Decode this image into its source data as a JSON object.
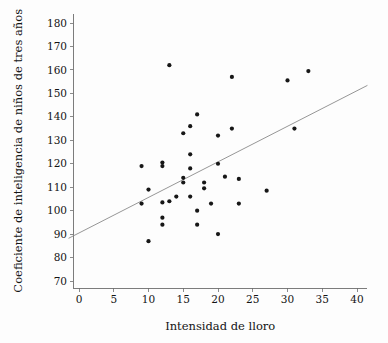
{
  "chart_data": {
    "type": "scatter",
    "title": "",
    "xlabel": "Intensidad de lloro",
    "ylabel": "Coeficiente de inteligencia de niños de tres años",
    "xlim": [
      -1.5,
      41.5
    ],
    "ylim": [
      66,
      184
    ],
    "xticks": [
      0,
      5,
      10,
      15,
      20,
      25,
      30,
      35,
      40
    ],
    "yticks": [
      70,
      80,
      90,
      100,
      110,
      120,
      130,
      140,
      150,
      160,
      170,
      180
    ],
    "xtick_labels": [
      "0",
      "5",
      "10",
      "15",
      "20",
      "25",
      "30",
      "35",
      "40"
    ],
    "ytick_labels": [
      "70",
      "80",
      "90",
      "100",
      "110",
      "120",
      "130",
      "140",
      "150",
      "160",
      "170",
      "180"
    ],
    "grid": false,
    "legend": false,
    "marker": {
      "shape": "circle",
      "size": 2.1,
      "color": "#171717"
    },
    "points": [
      {
        "x": 9,
        "y": 119
      },
      {
        "x": 9,
        "y": 103
      },
      {
        "x": 10,
        "y": 109
      },
      {
        "x": 10,
        "y": 87
      },
      {
        "x": 12,
        "y": 120.5
      },
      {
        "x": 12,
        "y": 119
      },
      {
        "x": 12,
        "y": 103.5
      },
      {
        "x": 12,
        "y": 97
      },
      {
        "x": 12,
        "y": 94
      },
      {
        "x": 13,
        "y": 162
      },
      {
        "x": 13,
        "y": 104
      },
      {
        "x": 14,
        "y": 106
      },
      {
        "x": 15,
        "y": 133
      },
      {
        "x": 15,
        "y": 114
      },
      {
        "x": 15,
        "y": 112
      },
      {
        "x": 16,
        "y": 136
      },
      {
        "x": 16,
        "y": 124
      },
      {
        "x": 16,
        "y": 118
      },
      {
        "x": 16,
        "y": 106
      },
      {
        "x": 17,
        "y": 141
      },
      {
        "x": 17,
        "y": 100
      },
      {
        "x": 17,
        "y": 94
      },
      {
        "x": 18,
        "y": 112
      },
      {
        "x": 18,
        "y": 109.5
      },
      {
        "x": 19,
        "y": 103
      },
      {
        "x": 20,
        "y": 132
      },
      {
        "x": 20,
        "y": 120
      },
      {
        "x": 20,
        "y": 90
      },
      {
        "x": 21,
        "y": 114.5
      },
      {
        "x": 22,
        "y": 157
      },
      {
        "x": 22,
        "y": 135
      },
      {
        "x": 23,
        "y": 113.5
      },
      {
        "x": 23,
        "y": 103
      },
      {
        "x": 27,
        "y": 108.5
      },
      {
        "x": 30,
        "y": 155.5
      },
      {
        "x": 31,
        "y": 135
      },
      {
        "x": 33,
        "y": 159.5
      }
    ],
    "fit_line": {
      "label": "linea de regresion",
      "x_start": -1.5,
      "y_start": 88.2,
      "x_end": 41.5,
      "y_end": 153.4,
      "color": "#8a8a8a"
    }
  }
}
